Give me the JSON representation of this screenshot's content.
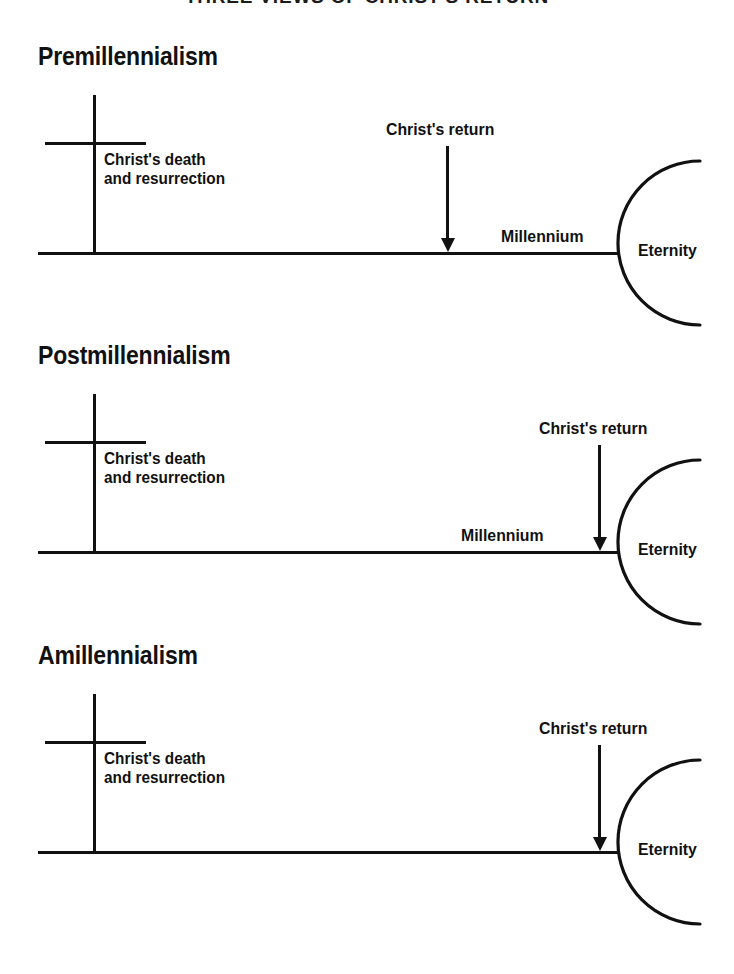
{
  "figure": {
    "title": "THREE VIEWS OF CHRIST'S RETURN",
    "ink_color": "#111111",
    "background_color": "#ffffff"
  },
  "views": [
    {
      "heading": "Premillennialism",
      "cross_caption_line1": "Christ's death",
      "cross_caption_line2": "and resurrection",
      "return_label": "Christ's return",
      "millennium_label": "Millennium",
      "eternity_label": "Eternity",
      "return_before_millennium": true
    },
    {
      "heading": "Postmillennialism",
      "cross_caption_line1": "Christ's death",
      "cross_caption_line2": "and resurrection",
      "return_label": "Christ's return",
      "millennium_label": "Millennium",
      "eternity_label": "Eternity",
      "return_before_millennium": false
    },
    {
      "heading": "Amillennialism",
      "cross_caption_line1": "Christ's death",
      "cross_caption_line2": "and resurrection",
      "return_label": "Christ's return",
      "millennium_label": "",
      "eternity_label": "Eternity",
      "return_before_millennium": false
    }
  ]
}
